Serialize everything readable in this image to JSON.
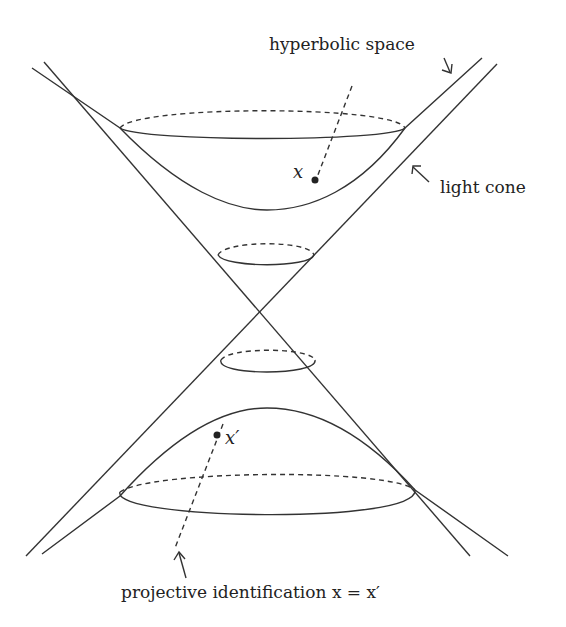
{
  "diagram": {
    "labels": {
      "hyperbolic_space": "hyperbolic space",
      "light_cone": "light cone",
      "point_x": "x",
      "point_x_prime": "x′",
      "projective_identification": "projective identification x = x′"
    },
    "elements": [
      "light-cone (two crossing lines)",
      "upper hyperboloid sheet",
      "lower hyperboloid sheet",
      "upper small cone cross-section ellipse",
      "lower small cone cross-section ellipse",
      "dashed line through origin connecting x and x′"
    ],
    "colors": {
      "stroke": "#333333",
      "background": "#ffffff"
    }
  }
}
